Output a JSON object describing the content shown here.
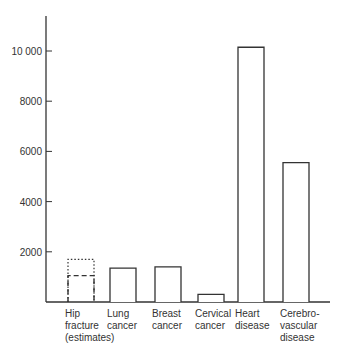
{
  "chart_data": {
    "type": "bar",
    "title": "",
    "xlabel": "",
    "ylabel": "",
    "ylim": [
      0,
      11500
    ],
    "yticks": [
      2000,
      4000,
      6000,
      8000,
      10000
    ],
    "ytick_labels": [
      "2000",
      "4000",
      "6000",
      "8000",
      "10 000"
    ],
    "grid": false,
    "legend": null,
    "categories": [
      "Hip fracture (estimates)",
      "Lung cancer",
      "Breast cancer",
      "Cervical cancer",
      "Heart disease",
      "Cerebrovascular disease"
    ],
    "category_labels": [
      "Hip\nfracture\n(estimates)",
      "Lung\ncancer",
      "Breast\ncancer",
      "Cervical\ncancer",
      "Heart\ndisease",
      "Cerebro-\nvascular\ndisease"
    ],
    "values": [
      1700,
      1350,
      1400,
      300,
      10150,
      5550
    ],
    "annotations": [
      {
        "category": "Hip fracture (estimates)",
        "style": "dotted",
        "value": 1700,
        "note": "upper estimate"
      },
      {
        "category": "Hip fracture (estimates)",
        "style": "dashed",
        "value": 1050,
        "note": "lower estimate"
      }
    ]
  },
  "colors": {
    "axis": "#333333",
    "bar_stroke": "#333333",
    "bar_fill": "#ffffff",
    "background": "#ffffff"
  }
}
